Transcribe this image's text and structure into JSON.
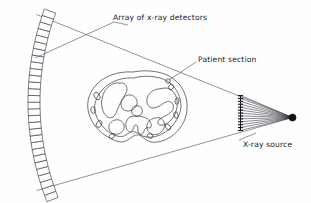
{
  "figure": {
    "background_color": "#fefefe",
    "line_color": "#3a3a46",
    "width": 311,
    "height": 203
  },
  "labels": {
    "detectors": "Array of x-ray detectors",
    "patient": "Patient section",
    "source": "X-ray source"
  },
  "components": {
    "detector_array": {
      "name": "Array of x-ray detectors",
      "shape": "curved-arc-of-rectangular-cells",
      "cell_count": 29,
      "color": "#3b3b47"
    },
    "patient_section": {
      "name": "Patient section",
      "shape": "axial-body-cross-section-outline",
      "color": "#41414d"
    },
    "x_ray_source": {
      "name": "X-ray source",
      "shape": "filled-dot",
      "color": "#111118"
    },
    "collimator": {
      "name": "collimator",
      "shape": "vertical-bar-with-ticks",
      "tick_count": 13,
      "color": "#1c1c24"
    },
    "fan_beam": {
      "name": "fan beam",
      "ray_count": 13,
      "color": "#2e2e38"
    }
  }
}
